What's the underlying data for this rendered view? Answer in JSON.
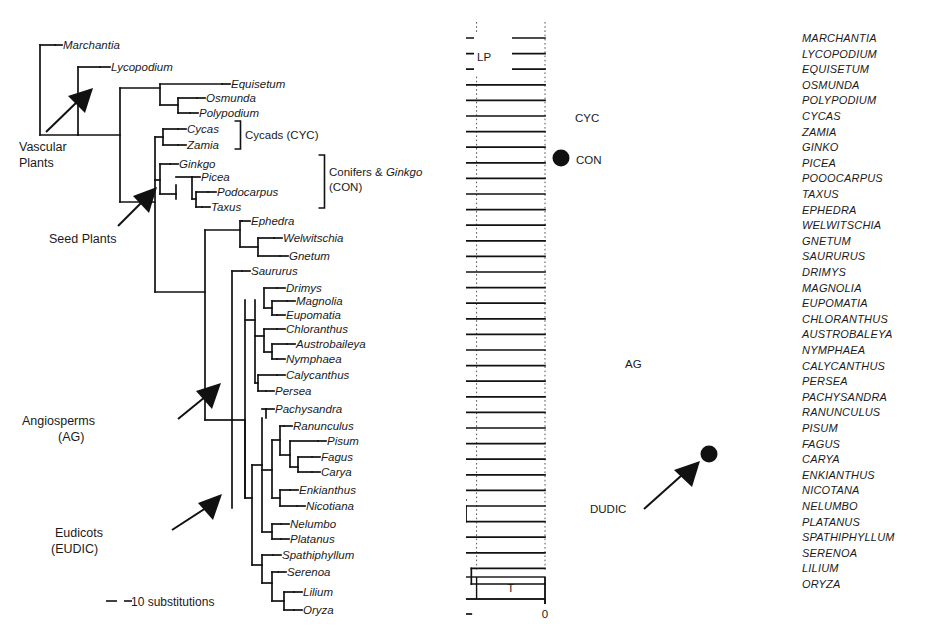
{
  "figure": {
    "panels": [
      "left-phylogram",
      "right-chronogram"
    ]
  },
  "left_tree": {
    "scale_bar_label": "10 substitutions",
    "tips": [
      {
        "name": "Marchantia"
      },
      {
        "name": "Lycopodium"
      },
      {
        "name": "Equisetum"
      },
      {
        "name": "Osmunda"
      },
      {
        "name": "Polypodium"
      },
      {
        "name": "Cycas"
      },
      {
        "name": "Zamia"
      },
      {
        "name": "Ginkgo"
      },
      {
        "name": "Picea"
      },
      {
        "name": "Podocarpus"
      },
      {
        "name": "Taxus"
      },
      {
        "name": "Ephedra"
      },
      {
        "name": "Welwitschia"
      },
      {
        "name": "Gnetum"
      },
      {
        "name": "Saururus"
      },
      {
        "name": "Drimys"
      },
      {
        "name": "Magnolia"
      },
      {
        "name": "Eupomatia"
      },
      {
        "name": "Chloranthus"
      },
      {
        "name": "Austrobaileya"
      },
      {
        "name": "Nymphaea"
      },
      {
        "name": "Calycanthus"
      },
      {
        "name": "Persea"
      },
      {
        "name": "Pachysandra"
      },
      {
        "name": "Ranunculus"
      },
      {
        "name": "Pisum"
      },
      {
        "name": "Fagus"
      },
      {
        "name": "Carya"
      },
      {
        "name": "Enkianthus"
      },
      {
        "name": "Nicotiana"
      },
      {
        "name": "Nelumbo"
      },
      {
        "name": "Platanus"
      },
      {
        "name": "Spathiphyllum"
      },
      {
        "name": "Serenoa"
      },
      {
        "name": "Lilium"
      },
      {
        "name": "Oryza"
      }
    ],
    "annotations": [
      {
        "id": "vascular-plants",
        "line1": "Vascular",
        "line2": "Plants"
      },
      {
        "id": "seed-plants",
        "line1": "Seed Plants",
        "line2": ""
      },
      {
        "id": "angiosperms",
        "line1": "Angiosperms",
        "line2": "(AG)"
      },
      {
        "id": "eudicots",
        "line1": "Eudicots",
        "line2": "(EUDIC)"
      }
    ],
    "brackets": [
      {
        "id": "cycads",
        "label": "Cycads (CYC)"
      },
      {
        "id": "conifers",
        "label_part1": "Conifers & ",
        "label_italic": "Ginkgo",
        "label_line2": "(CON)"
      }
    ]
  },
  "right_tree": {
    "tips": [
      {
        "name": "MARCHANTIA"
      },
      {
        "name": "LYCOPODIUM"
      },
      {
        "name": "EQUISETUM"
      },
      {
        "name": "OSMUNDA"
      },
      {
        "name": "POLYPODIUM"
      },
      {
        "name": "CYCAS"
      },
      {
        "name": "ZAMIA"
      },
      {
        "name": "GINKO"
      },
      {
        "name": "PICEA"
      },
      {
        "name": "POOOCARPUS"
      },
      {
        "name": "TAXUS"
      },
      {
        "name": "EPHEDRA"
      },
      {
        "name": "WELWITSCHIA"
      },
      {
        "name": "GNETUM"
      },
      {
        "name": "SAURURUS"
      },
      {
        "name": "DRIMYS"
      },
      {
        "name": "MAGNOLIA"
      },
      {
        "name": "EUPOMATIA"
      },
      {
        "name": "CHLORANTHUS"
      },
      {
        "name": "AUSTROBALEYA"
      },
      {
        "name": "NYMPHAEA"
      },
      {
        "name": "CALYCANTHUS"
      },
      {
        "name": "PERSEA"
      },
      {
        "name": "PACHYSANDRA"
      },
      {
        "name": "RANUNCULUS"
      },
      {
        "name": "PISUM"
      },
      {
        "name": "FAGUS"
      },
      {
        "name": "CARYA"
      },
      {
        "name": "ENKIANTHUS"
      },
      {
        "name": "NICOTANA"
      },
      {
        "name": "NELUMBO"
      },
      {
        "name": "PLATANUS"
      },
      {
        "name": "SPATHIPHYLLUM"
      },
      {
        "name": "SERENOA"
      },
      {
        "name": "LILIUM"
      },
      {
        "name": "ORYZA"
      }
    ],
    "node_labels": [
      {
        "id": "lp",
        "text": "LP"
      },
      {
        "id": "cyc",
        "text": "CYC"
      },
      {
        "id": "con",
        "text": "CON"
      },
      {
        "id": "ag",
        "text": "AG"
      },
      {
        "id": "dudic",
        "text": "DUDIC"
      }
    ],
    "calibration_nodes": 2
  },
  "chart_data": {
    "type": "tree",
    "title": "",
    "panels": [
      {
        "id": "left-phylogram",
        "kind": "phylogram",
        "xlabel": "substitutions",
        "scale_bar": {
          "length_units": 10,
          "label": "10 substitutions"
        },
        "n_taxa": 36
      },
      {
        "id": "right-chronogram",
        "kind": "chronogram",
        "xlabel": "Million years ago",
        "axis_ticks": [
          400,
          300,
          200,
          100,
          0
        ],
        "axis_range": [
          440,
          0
        ],
        "axis_direction": "reversed",
        "gridlines": true,
        "n_taxa": 36,
        "geologic_periods": [
          {
            "abbr": "S",
            "name": "Silurian",
            "start": 443,
            "end": 416
          },
          {
            "abbr": "D",
            "name": "Devonian",
            "start": 416,
            "end": 359
          },
          {
            "abbr": "C",
            "name": "Carboniferous",
            "start": 359,
            "end": 299
          },
          {
            "abbr": "P",
            "name": "Permian",
            "start": 299,
            "end": 251
          },
          {
            "abbr": "TR",
            "name": "Triassic",
            "start": 251,
            "end": 200
          },
          {
            "abbr": "J",
            "name": "Jurassic",
            "start": 200,
            "end": 145
          },
          {
            "abbr": "K",
            "name": "Cretaceous",
            "start": 145,
            "end": 65
          },
          {
            "abbr": "T",
            "name": "Tertiary",
            "start": 65,
            "end": 0
          }
        ]
      }
    ]
  }
}
